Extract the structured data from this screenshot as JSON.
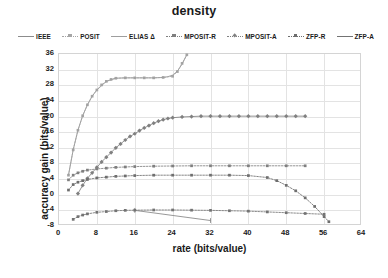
{
  "chart_data": {
    "type": "line",
    "title": "density",
    "xlabel": "rate (bits/value)",
    "ylabel": "accuracy gain (bits/value)",
    "xlim": [
      0,
      64
    ],
    "ylim": [
      -8,
      36
    ],
    "xticks": [
      0,
      8,
      16,
      24,
      32,
      40,
      48,
      56,
      64
    ],
    "yticks": [
      36,
      32,
      28,
      24,
      20,
      16,
      12,
      8,
      4,
      0,
      -4,
      -8
    ],
    "grid": true,
    "legend_position": "top",
    "series": [
      {
        "name": "IEEE",
        "color": "#8c8c8c",
        "style": "solid",
        "marker": "tick",
        "x": [
          16,
          32
        ],
        "y": [
          -4.0,
          -6.6
        ]
      },
      {
        "name": "Posit",
        "color": "#a6a6a6",
        "style": "dotted",
        "marker": "square",
        "x": [
          2,
          3,
          4,
          5,
          6,
          7,
          8,
          9,
          10,
          11,
          12,
          14,
          16,
          18,
          20,
          22,
          24,
          25,
          26,
          27
        ],
        "y": [
          5.0,
          11.5,
          16.5,
          20.2,
          23.0,
          25.2,
          26.8,
          28.1,
          29.0,
          29.5,
          29.8,
          29.9,
          29.9,
          29.9,
          29.9,
          30.0,
          30.3,
          31.5,
          33.6,
          35.8
        ]
      },
      {
        "name": "Elias Δ",
        "color": "#9e9e9e",
        "style": "solid",
        "marker": "none",
        "x": [
          2,
          3,
          4,
          5,
          6,
          7,
          8,
          10,
          12,
          14,
          16,
          18,
          20,
          22,
          23,
          24,
          25,
          26,
          27
        ],
        "y": [
          5.0,
          11.5,
          16.5,
          20.2,
          23.0,
          25.2,
          26.8,
          29.0,
          29.8,
          29.9,
          29.9,
          29.9,
          29.9,
          30.0,
          30.2,
          30.6,
          31.6,
          33.4,
          35.8
        ]
      },
      {
        "name": "MPosit-R",
        "color": "#7f7f7f",
        "style": "dotted",
        "marker": "square",
        "x": [
          2,
          3,
          4,
          5,
          6,
          8,
          10,
          12,
          14,
          16,
          20,
          24,
          28,
          32,
          36,
          40,
          44,
          48,
          52
        ],
        "y": [
          3.8,
          5.0,
          5.6,
          6.0,
          6.3,
          6.6,
          6.8,
          7.0,
          7.1,
          7.2,
          7.3,
          7.35,
          7.4,
          7.4,
          7.4,
          7.4,
          7.4,
          7.4,
          7.4
        ]
      },
      {
        "name": "MPosit-A",
        "color": "#808080",
        "style": "solid-markers",
        "marker": "diamond",
        "x": [
          4,
          5,
          6,
          7,
          8,
          9,
          10,
          11,
          12,
          13,
          14,
          15,
          16,
          17,
          18,
          19,
          20,
          21,
          22,
          23,
          24,
          26,
          28,
          30,
          32,
          34,
          36,
          38,
          40,
          42,
          44,
          46,
          48,
          50,
          52
        ],
        "y": [
          0.3,
          2.4,
          4.2,
          5.6,
          7.0,
          8.4,
          9.6,
          10.8,
          12.0,
          13.0,
          14.0,
          14.9,
          15.6,
          16.4,
          17.1,
          17.7,
          18.3,
          18.8,
          19.2,
          19.5,
          19.7,
          19.9,
          20.0,
          20.1,
          20.1,
          20.1,
          20.1,
          20.1,
          20.1,
          20.1,
          20.1,
          20.1,
          20.1,
          20.1,
          20.1
        ]
      },
      {
        "name": "ZFP-R",
        "color": "#6e6e6e",
        "style": "dotted",
        "marker": "square",
        "x": [
          2,
          3,
          4,
          5,
          6,
          8,
          10,
          12,
          14,
          16,
          20,
          24,
          28,
          32,
          36,
          40,
          44,
          46,
          48,
          50,
          52,
          54,
          56,
          57
        ],
        "y": [
          1.2,
          2.6,
          3.2,
          3.6,
          3.9,
          4.3,
          4.5,
          4.7,
          4.8,
          4.9,
          5.0,
          5.0,
          5.0,
          5.0,
          5.0,
          4.9,
          4.4,
          3.6,
          2.4,
          1.0,
          -0.8,
          -3.0,
          -5.6,
          -6.9
        ]
      },
      {
        "name": "ZFP-A",
        "color": "#737373",
        "style": "dotted",
        "marker": "square",
        "x": [
          3,
          4,
          5,
          6,
          8,
          10,
          12,
          14,
          16,
          20,
          24,
          28,
          32,
          36,
          40,
          44,
          48,
          52,
          56
        ],
        "y": [
          -6.3,
          -5.6,
          -5.2,
          -4.9,
          -4.5,
          -4.3,
          -4.1,
          -4.0,
          -3.95,
          -3.9,
          -3.9,
          -3.95,
          -4.0,
          -4.1,
          -4.2,
          -4.4,
          -4.6,
          -4.8,
          -5.0
        ]
      }
    ]
  },
  "legend": {
    "items": [
      {
        "label": "IEEE",
        "color": "#8c8c8c",
        "marker": "none"
      },
      {
        "label": "Posit",
        "color": "#a6a6a6",
        "marker": "square"
      },
      {
        "label": "Elias Δ",
        "color": "#9e9e9e",
        "marker": "none"
      },
      {
        "label": "MPosit-R",
        "color": "#7f7f7f",
        "marker": "square"
      },
      {
        "label": "MPosit-A",
        "color": "#808080",
        "marker": "diamond"
      },
      {
        "label": "ZFP-R",
        "color": "#6e6e6e",
        "marker": "square"
      },
      {
        "label": "ZFP-A",
        "color": "#737373",
        "marker": "none"
      }
    ]
  }
}
